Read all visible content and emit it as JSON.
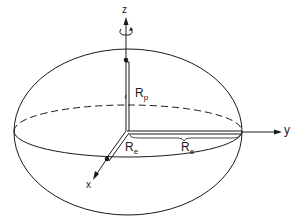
{
  "diagram": {
    "axes": {
      "z": "z",
      "y": "y",
      "x": "x"
    },
    "labels": {
      "polar_radius": {
        "main": "R",
        "sub": "p"
      },
      "equatorial_radius_x": {
        "main": "R",
        "sub": "e"
      },
      "equatorial_radius_y": {
        "main": "R",
        "sub": "e"
      }
    },
    "colors": {
      "stroke": "#1a1a1a",
      "background": "#ffffff"
    }
  }
}
